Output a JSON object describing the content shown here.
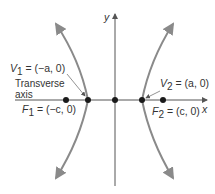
{
  "diagram": {
    "type": "hyperbola",
    "axes": {
      "x_label": "x",
      "y_label": "y"
    },
    "vertex_left": {
      "name": "V",
      "sub": "1",
      "coords": " = (−a, 0)"
    },
    "vertex_right": {
      "name": "V",
      "sub": "2",
      "coords": " = (a, 0)"
    },
    "focus_left": {
      "name": "F",
      "sub": "1",
      "coords": " = (−c, 0)"
    },
    "focus_right": {
      "name": "F",
      "sub": "2",
      "coords": " = (c, 0)"
    },
    "transverse_axis_label": [
      "Transverse",
      "axis"
    ],
    "colors": {
      "curve": "#8a8a8a",
      "axis": "#555555",
      "point": "#1a1a1a",
      "text": "#333333"
    }
  }
}
